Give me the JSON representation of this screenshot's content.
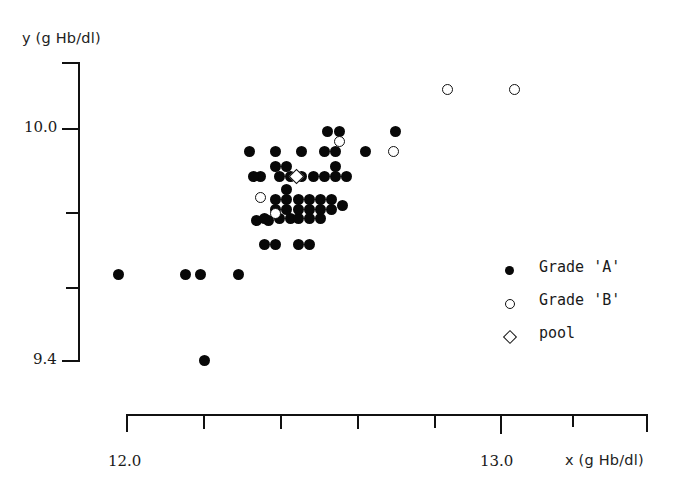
{
  "chart_data": {
    "type": "scatter",
    "title": "",
    "xlabel": "x (g Hb/dl)",
    "ylabel": "y (g Hb/dl)",
    "xlim": [
      11.92,
      13.28
    ],
    "ylim": [
      9.36,
      10.18
    ],
    "grid": false,
    "legend_position": "middle-right",
    "x_tick_labels": [
      "12.0",
      "13.0"
    ],
    "y_tick_labels": [
      "10.0",
      "9.4"
    ],
    "x_ticks_values": [
      12.0,
      12.2,
      12.4,
      12.6,
      12.8,
      13.0,
      13.2
    ],
    "y_ticks_values": [
      10.0,
      9.8,
      9.6,
      9.4
    ],
    "series": [
      {
        "name": "Grade 'A'",
        "marker": "filled-circle",
        "color": "#080808",
        "points": [
          [
            11.98,
            9.62
          ],
          [
            12.16,
            9.62
          ],
          [
            12.2,
            9.62
          ],
          [
            12.3,
            9.62
          ],
          [
            12.21,
            9.4
          ],
          [
            12.37,
            9.7
          ],
          [
            12.4,
            9.7
          ],
          [
            12.46,
            9.7
          ],
          [
            12.49,
            9.7
          ],
          [
            12.35,
            9.76
          ],
          [
            12.38,
            9.76
          ],
          [
            12.37,
            9.765
          ],
          [
            12.41,
            9.765
          ],
          [
            12.44,
            9.765
          ],
          [
            12.46,
            9.765
          ],
          [
            12.49,
            9.765
          ],
          [
            12.52,
            9.765
          ],
          [
            12.4,
            9.79
          ],
          [
            12.43,
            9.79
          ],
          [
            12.46,
            9.79
          ],
          [
            12.49,
            9.79
          ],
          [
            12.52,
            9.79
          ],
          [
            12.55,
            9.79
          ],
          [
            12.4,
            9.815
          ],
          [
            12.43,
            9.815
          ],
          [
            12.46,
            9.815
          ],
          [
            12.49,
            9.815
          ],
          [
            12.52,
            9.815
          ],
          [
            12.55,
            9.815
          ],
          [
            12.43,
            9.84
          ],
          [
            12.58,
            9.8
          ],
          [
            12.36,
            9.875
          ],
          [
            12.41,
            9.875
          ],
          [
            12.44,
            9.875
          ],
          [
            12.47,
            9.875
          ],
          [
            12.4,
            9.9
          ],
          [
            12.43,
            9.9
          ],
          [
            12.53,
            9.875
          ],
          [
            12.56,
            9.875
          ],
          [
            12.59,
            9.875
          ],
          [
            12.56,
            9.9
          ],
          [
            12.34,
            9.875
          ],
          [
            12.5,
            9.875
          ],
          [
            12.33,
            9.94
          ],
          [
            12.4,
            9.94
          ],
          [
            12.47,
            9.94
          ],
          [
            12.53,
            9.94
          ],
          [
            12.56,
            9.94
          ],
          [
            12.64,
            9.94
          ],
          [
            12.54,
            9.99
          ],
          [
            12.57,
            9.99
          ],
          [
            12.72,
            9.99
          ]
        ]
      },
      {
        "name": "Grade 'B'",
        "marker": "open-circle",
        "color": "#111111",
        "points": [
          [
            12.36,
            9.82
          ],
          [
            12.4,
            9.78
          ],
          [
            12.57,
            9.965
          ],
          [
            12.715,
            9.94
          ],
          [
            12.86,
            10.1
          ],
          [
            13.04,
            10.1
          ]
        ]
      },
      {
        "name": "pool",
        "marker": "open-diamond",
        "color": "#111111",
        "points": [
          [
            12.455,
            9.875
          ]
        ]
      }
    ]
  },
  "axes": {
    "y_label": "y (g Hb/dl)",
    "x_label": "x (g Hb/dl)",
    "y_ticks": [
      {
        "label": "10.0",
        "value": 10.0,
        "major": true
      },
      {
        "label": "",
        "value": 9.8,
        "major": false
      },
      {
        "label": "",
        "value": 9.6,
        "major": false
      },
      {
        "label": "9.4",
        "value": 9.4,
        "major": true
      }
    ],
    "x_ticks": [
      {
        "label": "12.0",
        "value": 12.0,
        "major": true
      },
      {
        "label": "",
        "value": 12.2,
        "major": false
      },
      {
        "label": "",
        "value": 12.4,
        "major": false
      },
      {
        "label": "",
        "value": 12.6,
        "major": false
      },
      {
        "label": "",
        "value": 12.8,
        "major": false
      },
      {
        "label": "13.0",
        "value": 13.0,
        "major": true
      },
      {
        "label": "",
        "value": 13.2,
        "major": false
      }
    ]
  },
  "legend": {
    "items": [
      {
        "label": "Grade 'A'",
        "marker": "filled-circle"
      },
      {
        "label": "Grade 'B'",
        "marker": "open-circle"
      },
      {
        "label": "pool",
        "marker": "open-diamond"
      }
    ]
  }
}
